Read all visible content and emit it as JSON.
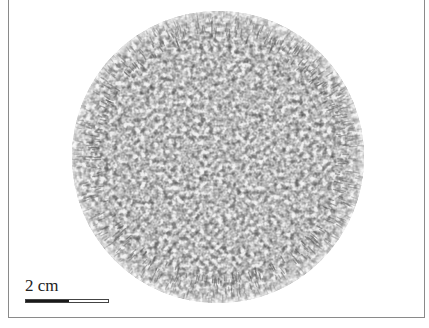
{
  "figure": {
    "circle": {
      "center_x": 218,
      "center_y": 157,
      "radius": 146
    },
    "colors": {
      "background": "#ffffff",
      "frame_border": "#8a8a8a",
      "pattern_dark": "#3a3a3a",
      "pattern_light": "#ffffff",
      "scale_bar_dark": "#1a1a1a"
    }
  },
  "scale_bar": {
    "label": "2 cm",
    "filled_fraction_percent": 52
  }
}
